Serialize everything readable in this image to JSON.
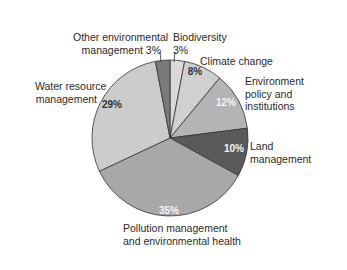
{
  "chart_data": {
    "type": "pie",
    "title": "",
    "start_angle_deg": 0,
    "direction": "clockwise",
    "slices": [
      {
        "label": "Biodiversity",
        "value": 3,
        "value_label": "3%",
        "color": "#d9d9d9"
      },
      {
        "label": "Climate change",
        "value": 8,
        "value_label": "8%",
        "color": "#d0d0d0"
      },
      {
        "label": "Environment policy and institutions",
        "value": 12,
        "value_label": "12%",
        "color": "#b4b4b4"
      },
      {
        "label": "Land management",
        "value": 10,
        "value_label": "10%",
        "color": "#5a5a5a"
      },
      {
        "label": "Pollution management and environmental health",
        "value": 35,
        "value_label": "35%",
        "color": "#a8a8a8"
      },
      {
        "label": "Water resource management",
        "value": 29,
        "value_label": "29%",
        "color": "#cccccc"
      },
      {
        "label": "Other environmental management",
        "value": 3,
        "value_label": "3%",
        "color": "#7a7a7a"
      }
    ],
    "legend": "none (direct labels)"
  },
  "labels": {
    "other_line1": "Other environmental",
    "other_line2": "management 3%",
    "bio_line1": "Biodiversity",
    "bio_line2": "3%",
    "climate": "Climate change",
    "climate_pct": "8%",
    "envpol_line1": "Environment",
    "envpol_line2": "policy and",
    "envpol_line3": "institutions",
    "envpol_pct": "12%",
    "land_line1": "Land",
    "land_line2": "management",
    "land_pct": "10%",
    "water_line1": "Water resource",
    "water_line2": "management",
    "water_pct": "29%",
    "poll_line1": "Pollution management",
    "poll_line2": "and environmental health",
    "poll_pct": "35%"
  }
}
